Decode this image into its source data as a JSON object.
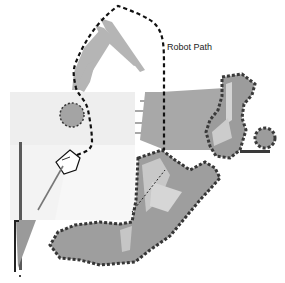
{
  "figure": {
    "annotations": [
      {
        "text": "Robot Path",
        "x": 167,
        "y": 42
      }
    ],
    "elements": {
      "robot_path": "dashed-black",
      "robot": "pentagon-outline",
      "heading_arrow": "gray-line",
      "obstacles": [
        "circle-obstacle",
        "occupied-cells",
        "sonar-cone"
      ]
    },
    "colors": {
      "free_space": "#eeeeee",
      "free_space_light": "#f4f4f4",
      "occupied_fill": "#a0a0a0",
      "occupied_border": "#404040",
      "sensor_rays": "#b8b8b8",
      "path": "#111111"
    }
  }
}
